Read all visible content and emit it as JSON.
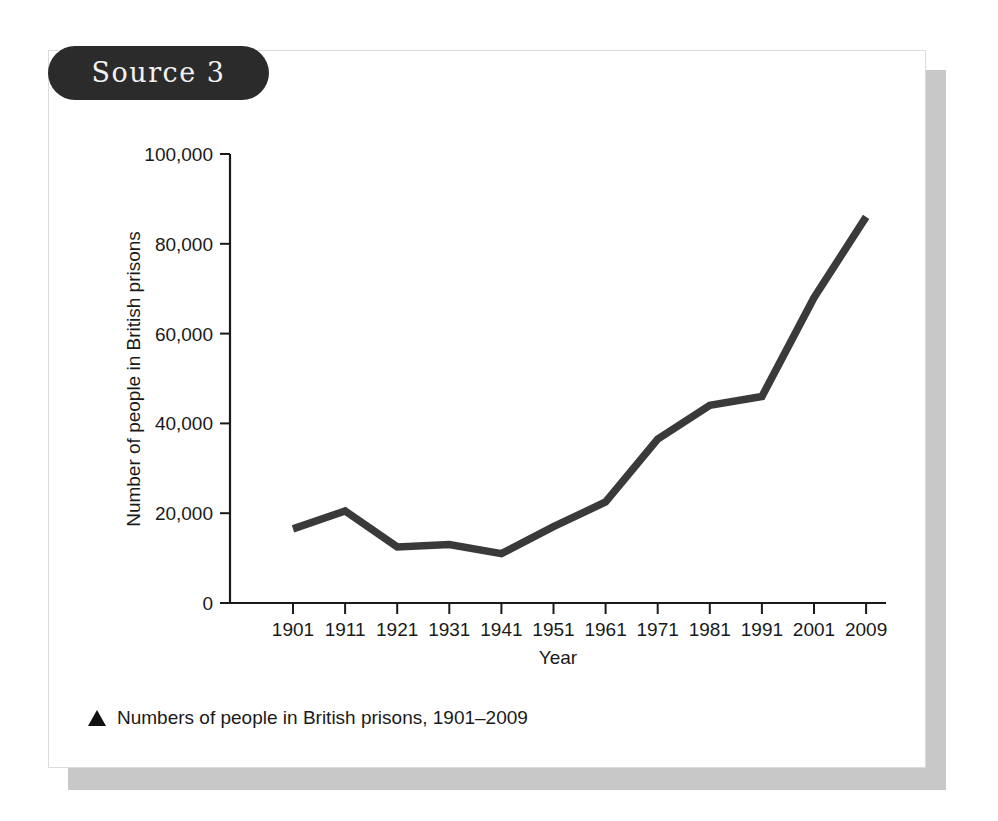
{
  "card": {
    "source_label": "Source 3"
  },
  "caption": {
    "marker": "triangle-up",
    "text": "Numbers of people in British prisons, 1901–2009"
  },
  "chart_data": {
    "type": "line",
    "title": "",
    "xlabel": "Year",
    "ylabel": "Number of people in British prisons",
    "categories": [
      "1901",
      "1911",
      "1921",
      "1931",
      "1941",
      "1951",
      "1961",
      "1971",
      "1981",
      "1991",
      "2001",
      "2009"
    ],
    "x": [
      1901,
      1911,
      1921,
      1931,
      1941,
      1951,
      1961,
      1971,
      1981,
      1991,
      2001,
      2009
    ],
    "values": [
      16500,
      20500,
      12500,
      13000,
      11000,
      17000,
      22500,
      36500,
      44000,
      46000,
      68000,
      86000
    ],
    "series": [
      {
        "name": "Number of people in British prisons",
        "values": [
          16500,
          20500,
          12500,
          13000,
          11000,
          17000,
          22500,
          36500,
          44000,
          46000,
          68000,
          86000
        ]
      }
    ],
    "ytick_labels": [
      "0",
      "20,000",
      "40,000",
      "60,000",
      "80,000",
      "100,000"
    ],
    "ytick_values": [
      0,
      20000,
      40000,
      60000,
      80000,
      100000
    ],
    "xtick_labels": [
      "1901",
      "1911",
      "1921",
      "1931",
      "1941",
      "1951",
      "1961",
      "1971",
      "1981",
      "1991",
      "2001",
      "2009"
    ],
    "ylim": [
      0,
      100000
    ],
    "xlim": [
      1901,
      2009
    ],
    "grid": false,
    "legend": false,
    "line_color": "#3a3a3a",
    "axis_color": "#1a1a1a"
  }
}
